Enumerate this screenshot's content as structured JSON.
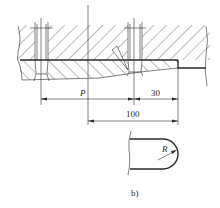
{
  "figure": {
    "caption": "b)",
    "dimensions": {
      "pitch_label": "P",
      "edge_distance": "30",
      "overall": "100",
      "radius_label": "R"
    }
  },
  "colors": {
    "line": "#2a2a2a",
    "background": "#ffffff"
  }
}
